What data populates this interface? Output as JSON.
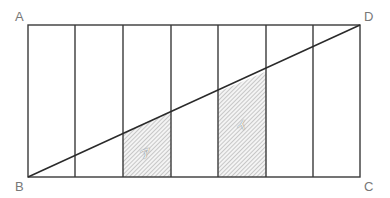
{
  "diagram": {
    "type": "geometry-rectangle-with-diagonal",
    "vertices": {
      "A": {
        "label": "A",
        "x": 28,
        "y": 25
      },
      "B": {
        "label": "B",
        "x": 28,
        "y": 177
      },
      "C": {
        "label": "C",
        "x": 360,
        "y": 177
      },
      "D": {
        "label": "D",
        "x": 360,
        "y": 25
      }
    },
    "columns": 7,
    "column_lines_x": [
      28,
      75,
      123,
      171,
      218,
      266,
      313,
      360
    ],
    "diagonal": {
      "from": "B",
      "to": "D"
    },
    "shaded_regions": [
      {
        "label": "ア",
        "column_index": 2,
        "x_left": 123,
        "x_right": 171
      },
      {
        "label": "イ",
        "column_index": 4,
        "x_left": 218,
        "x_right": 266
      }
    ],
    "colors": {
      "line": "#333333",
      "label": "#777777",
      "hatch": "#999999"
    }
  }
}
